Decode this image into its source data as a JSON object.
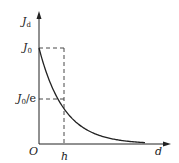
{
  "diagram": {
    "type": "exponential-decay-plot",
    "y_axis": {
      "label_main": "J",
      "label_sub": "d"
    },
    "x_axis": {
      "label": "d"
    },
    "origin_label": "O",
    "y_ticks": [
      {
        "main": "J",
        "sub": "0",
        "suffix": ""
      },
      {
        "main": "J",
        "sub": "0",
        "suffix": "/e"
      }
    ],
    "x_ticks": [
      {
        "label": "h"
      }
    ],
    "curve": "J_d = J_0 · exp(-d / h)",
    "colors": {
      "line": "#222222",
      "dash": "#333333",
      "background": "#ffffff"
    }
  }
}
